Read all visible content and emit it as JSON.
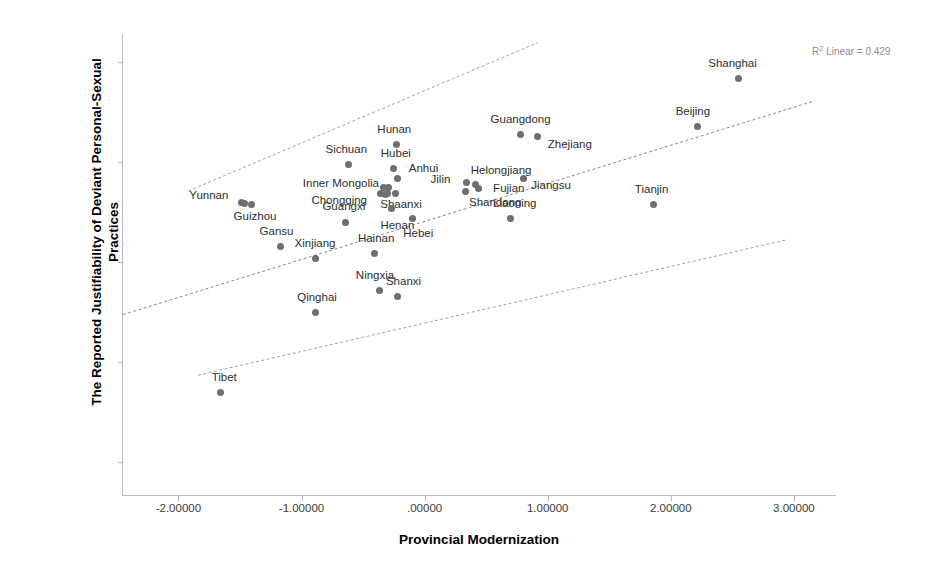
{
  "chart_data": {
    "type": "scatter",
    "title": "",
    "xlabel": "Provincial Modernization",
    "ylabel": "The Reported Justifiability of Deviant Personal-Sexual Practices",
    "ylabel_lines": [
      "The Reported Justifiability of Deviant Personal-Sexual",
      "Practices"
    ],
    "annotation": "R² Linear = 0.429",
    "annotation_prefix": "R",
    "annotation_sup": "2",
    "annotation_suffix": " Linear = 0.429",
    "r_squared": 0.429,
    "grid": false,
    "legend": "none",
    "xlim": [
      -2.45,
      3.35
    ],
    "ylim": [
      2.33,
      4.64
    ],
    "xticks": [
      -2,
      -1,
      0,
      1,
      2,
      3
    ],
    "xticklabels": [
      "-2.00000",
      "-1.00000",
      ".00000",
      "1.00000",
      "2.00000",
      "3.00000"
    ],
    "yticks": [
      2.5,
      3.0,
      3.5,
      4.0,
      4.5
    ],
    "yticklabels": [
      "2.50",
      "3.00",
      "3.50",
      "4.00",
      "4.50"
    ],
    "marker_color": "#6f6f6f",
    "line_color": "#8a8a8a",
    "fit_line": {
      "x": [
        -2.45,
        3.17
      ],
      "y": [
        3.237,
        4.306
      ]
    },
    "upper_band": {
      "x": [
        -1.92,
        0.92
      ],
      "y": [
        3.855,
        4.597
      ]
    },
    "lower_band": {
      "x": [
        -1.84,
        2.94
      ],
      "y": [
        2.934,
        3.611
      ]
    },
    "points": [
      {
        "label": "Shanghai",
        "x": 2.55,
        "y": 4.42,
        "label_dx": -6,
        "label_dy": -9
      },
      {
        "label": "Beijing",
        "x": 2.22,
        "y": 4.18,
        "label_dx": -5,
        "label_dy": -9
      },
      {
        "label": "Guangdong",
        "x": 0.78,
        "y": 4.14,
        "label_dx": 0,
        "label_dy": -9
      },
      {
        "label": "Zhejiang",
        "x": 0.92,
        "y": 4.13,
        "label_dx": 32,
        "label_dy": 14
      },
      {
        "label": "Hunan",
        "x": -0.23,
        "y": 4.09,
        "label_dx": -2,
        "label_dy": -9
      },
      {
        "label": "Hubei",
        "x": -0.25,
        "y": 3.97,
        "label_dx": 2,
        "label_dy": -9
      },
      {
        "label": "Sichuan",
        "x": -0.62,
        "y": 3.99,
        "label_dx": -2,
        "label_dy": -9
      },
      {
        "label": "Anhui",
        "x": -0.22,
        "y": 3.92,
        "label_dx": 26,
        "label_dy": -4
      },
      {
        "label": "Jilin",
        "x": 0.34,
        "y": 3.9,
        "label_dx": -26,
        "label_dy": 3
      },
      {
        "label": "Helongjiang",
        "x": 0.41,
        "y": 3.89,
        "label_dx": 26,
        "label_dy": -8
      },
      {
        "label": "Jiangsu",
        "x": 0.8,
        "y": 3.92,
        "label_dx": 28,
        "label_dy": 13
      },
      {
        "label": "Fujian",
        "x": 0.44,
        "y": 3.87,
        "label_dx": 30,
        "label_dy": 6
      },
      {
        "label": "Inner Mongolia",
        "x": -0.29,
        "y": 3.875,
        "label_dx": -48,
        "label_dy": 2
      },
      {
        "label": "Chongqing",
        "x": -0.32,
        "y": 3.84,
        "label_dx": -46,
        "label_dy": 12
      },
      {
        "label": "Shaanxi",
        "x": -0.24,
        "y": 3.845,
        "label_dx": 6,
        "label_dy": 17
      },
      {
        "label": "Shandong",
        "x": 0.33,
        "y": 3.855,
        "label_dx": 30,
        "label_dy": 17
      },
      {
        "label": "Liaoning",
        "x": 0.7,
        "y": 3.72,
        "label_dx": 4,
        "label_dy": -9
      },
      {
        "label": "Tianjin",
        "x": 1.86,
        "y": 3.79,
        "label_dx": -2,
        "label_dy": -9
      },
      {
        "label": "Yunnan",
        "x": -1.46,
        "y": 3.795,
        "label_dx": -36,
        "label_dy": -2
      },
      {
        "label": "Guizhou",
        "x": -1.41,
        "y": 3.79,
        "label_dx": 4,
        "label_dy": 18
      },
      {
        "label": "Guangxi",
        "x": -0.64,
        "y": 3.7,
        "label_dx": -2,
        "label_dy": -10
      },
      {
        "label": "Henan",
        "x": -0.27,
        "y": 3.77,
        "label_dx": 6,
        "label_dy": 23
      },
      {
        "label": "Hebei",
        "x": -0.1,
        "y": 3.72,
        "label_dx": 6,
        "label_dy": 21
      },
      {
        "label": "Gansu",
        "x": -1.17,
        "y": 3.58,
        "label_dx": -4,
        "label_dy": -9
      },
      {
        "label": "Xinjiang",
        "x": -0.89,
        "y": 3.52,
        "label_dx": 0,
        "label_dy": -9
      },
      {
        "label": "Hainan",
        "x": -0.41,
        "y": 3.545,
        "label_dx": 2,
        "label_dy": -9
      },
      {
        "label": "Shanxi",
        "x": -0.22,
        "y": 3.33,
        "label_dx": 6,
        "label_dy": -9
      },
      {
        "label": "Ningxia",
        "x": -0.37,
        "y": 3.36,
        "label_dx": -4,
        "label_dy": -9
      },
      {
        "label": "Qinghai",
        "x": -0.89,
        "y": 3.25,
        "label_dx": 2,
        "label_dy": -9
      },
      {
        "label": "Tibet",
        "x": -1.66,
        "y": 2.85,
        "label_dx": 4,
        "label_dy": -9
      }
    ],
    "extra_cluster_points": [
      {
        "x": -0.335,
        "y": 3.873
      },
      {
        "x": -0.3,
        "y": 3.843
      },
      {
        "x": -0.355,
        "y": 3.845
      },
      {
        "x": -1.485,
        "y": 3.8
      }
    ]
  }
}
